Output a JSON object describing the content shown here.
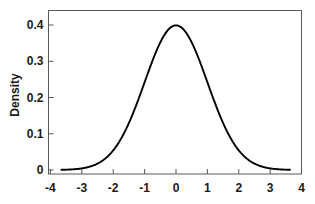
{
  "chart_data": {
    "type": "line",
    "title": "",
    "subtitle": "",
    "xlabel": "",
    "ylabel": "Density",
    "distribution": "standard normal density (mean 0, sd 1)",
    "xlim": [
      -4,
      4
    ],
    "ylim": [
      0,
      0.43
    ],
    "grid": false,
    "legend": null,
    "xticks": [
      "-4",
      "-3",
      "-2",
      "-1",
      "0",
      "1",
      "2",
      "3",
      "4"
    ],
    "xtick_values": [
      -4,
      -3,
      -2,
      -1,
      0,
      1,
      2,
      3,
      4
    ],
    "yticks": [
      "0",
      "0.1",
      "0.2",
      "0.3",
      "0.4"
    ],
    "ytick_values": [
      0,
      0.1,
      0.2,
      0.3,
      0.4
    ],
    "line_color": "#000000",
    "axis_color": "#5a5a5a",
    "curve_x_range": [
      -3.65,
      3.63
    ],
    "peak": {
      "x": 0,
      "y": 0.399
    },
    "x": [
      -3.65,
      -3.5,
      -3.25,
      -3.0,
      -2.75,
      -2.5,
      -2.25,
      -2.0,
      -1.75,
      -1.5,
      -1.25,
      -1.0,
      -0.75,
      -0.5,
      -0.25,
      0.0,
      0.25,
      0.5,
      0.75,
      1.0,
      1.25,
      1.5,
      1.75,
      2.0,
      2.25,
      2.5,
      2.75,
      3.0,
      3.25,
      3.5,
      3.63
    ],
    "values": [
      0.0006,
      0.0009,
      0.002,
      0.0044,
      0.0091,
      0.0175,
      0.0317,
      0.054,
      0.0863,
      0.1295,
      0.1826,
      0.242,
      0.3011,
      0.3521,
      0.3867,
      0.3989,
      0.3867,
      0.3521,
      0.3011,
      0.242,
      0.1826,
      0.1295,
      0.0863,
      0.054,
      0.0317,
      0.0175,
      0.0091,
      0.0044,
      0.002,
      0.0009,
      0.0006
    ]
  }
}
